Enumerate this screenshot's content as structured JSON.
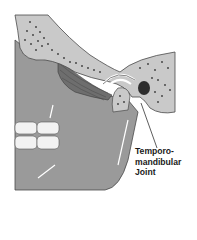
{
  "figure": {
    "label": {
      "line1": "Temporo-",
      "line2": "mandibular",
      "line3": "Joint"
    },
    "colors": {
      "background": "#ffffff",
      "bone": "#c9c9c9",
      "bone_dots": "#3a3a3a",
      "mandible": "#9a9a9a",
      "muscle_dark": "#6e6e6e",
      "outline": "#4a4a4a",
      "teeth": "#f2f2f2",
      "ear_canal": "#2e2e2e",
      "leader_line": "#333333"
    }
  }
}
